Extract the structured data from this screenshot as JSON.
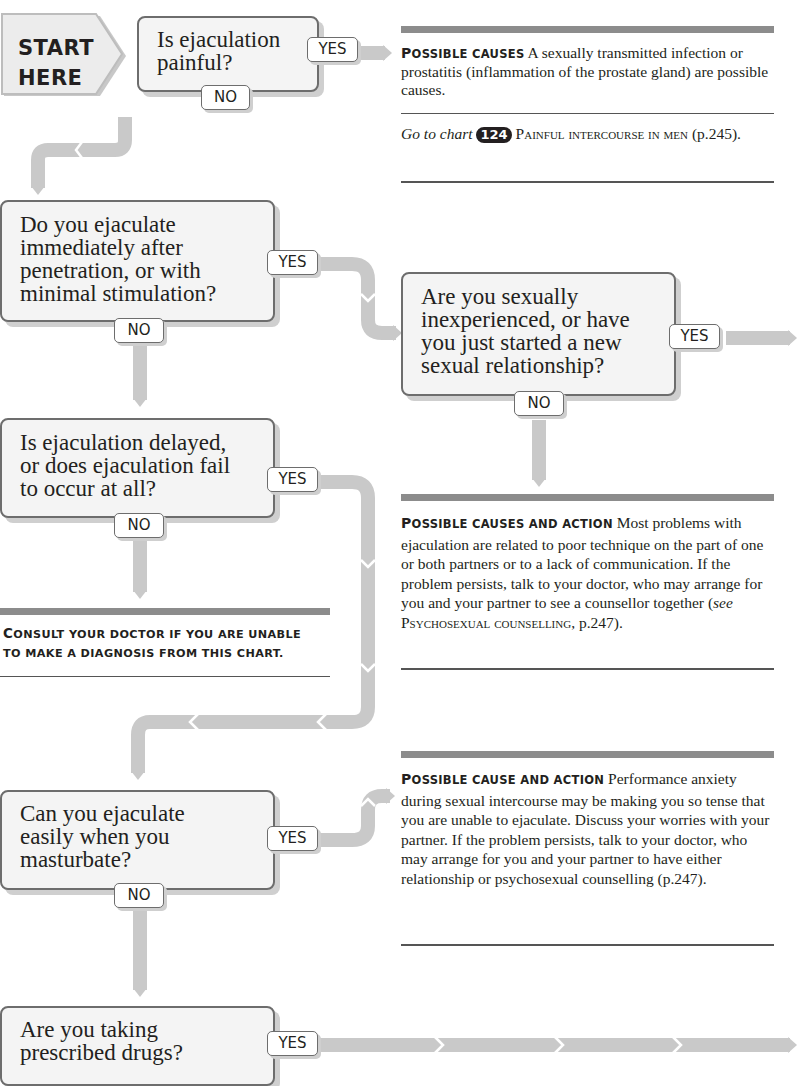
{
  "start": {
    "line1": "START",
    "line2": "HERE"
  },
  "questions": [
    {
      "id": "q1",
      "text": "Is ejaculation painful?",
      "lines": [
        "Is ejaculation",
        "painful?"
      ],
      "yes": "YES",
      "no": "NO"
    },
    {
      "id": "q2",
      "text": "Do you ejaculate immediately after penetration, or with minimal stimulation?",
      "lines": [
        "Do you ejaculate",
        "immediately after",
        "penetration, or with",
        "minimal stimulation?"
      ],
      "yes": "YES",
      "no": "NO"
    },
    {
      "id": "q3",
      "text": "Are you sexually inexperienced, or have you just started a new sexual relationship?",
      "lines": [
        "Are you sexually",
        "inexperienced, or have",
        "you just started a new",
        "sexual relationship?"
      ],
      "yes": "YES",
      "no": "NO"
    },
    {
      "id": "q4",
      "text": "Is ejaculation delayed, or does ejaculation fail to occur at all?",
      "lines": [
        "Is ejaculation delayed,",
        "or does ejaculation fail",
        "to occur at all?"
      ],
      "yes": "YES",
      "no": "NO"
    },
    {
      "id": "q5",
      "text": "Can you ejaculate easily when you masturbate?",
      "lines": [
        "Can you ejaculate",
        "easily when you",
        "masturbate?"
      ],
      "yes": "YES",
      "no": "NO"
    },
    {
      "id": "q6",
      "text": "Are you taking prescribed drugs?",
      "lines": [
        "Are you taking",
        "prescribed drugs?"
      ],
      "yes": "YES"
    }
  ],
  "panels": {
    "painful": {
      "heading_first": "P",
      "heading_rest": "ossible causes",
      "body": "A sexually transmitted infection or prostatitis (inflammation of the prostate gland) are possible causes.",
      "goto_prefix": "Go to chart",
      "goto_chart_number": "124",
      "goto_title": "Painful intercourse in men",
      "goto_page": "(p.245)."
    },
    "inexperience": {
      "heading_first": "P",
      "heading_rest": "ossible causes and action",
      "body": "Most problems with ejaculation are related to poor technique on the part of one or both partners or to a lack of communication. If the problem persists, talk to your doctor, who may arrange for you and your partner to see a counsellor together (",
      "see": "see",
      "ref_title": "Psychosexual counselling",
      "ref_page": ", p.247)."
    },
    "anxiety": {
      "heading_first": "P",
      "heading_rest": "ossible cause and action",
      "body": "Performance anxiety during sexual intercourse may be making you so tense that you are unable to ejaculate. Discuss your worries with your partner. If the problem persists, talk to your doctor, who may arrange for you and your partner to have either relationship or psychosexual counselling (p.247)."
    }
  },
  "consult": {
    "first": "C",
    "line1_rest": "onsult your doctor if you are unable",
    "line2": "to make a diagnosis from this chart."
  },
  "colors": {
    "connector": "#c9c9c9",
    "box_fill": "#f4f4f4",
    "box_border": "#6d6d6d",
    "panel_bar": "#8c8c8c",
    "text": "#231f20"
  }
}
